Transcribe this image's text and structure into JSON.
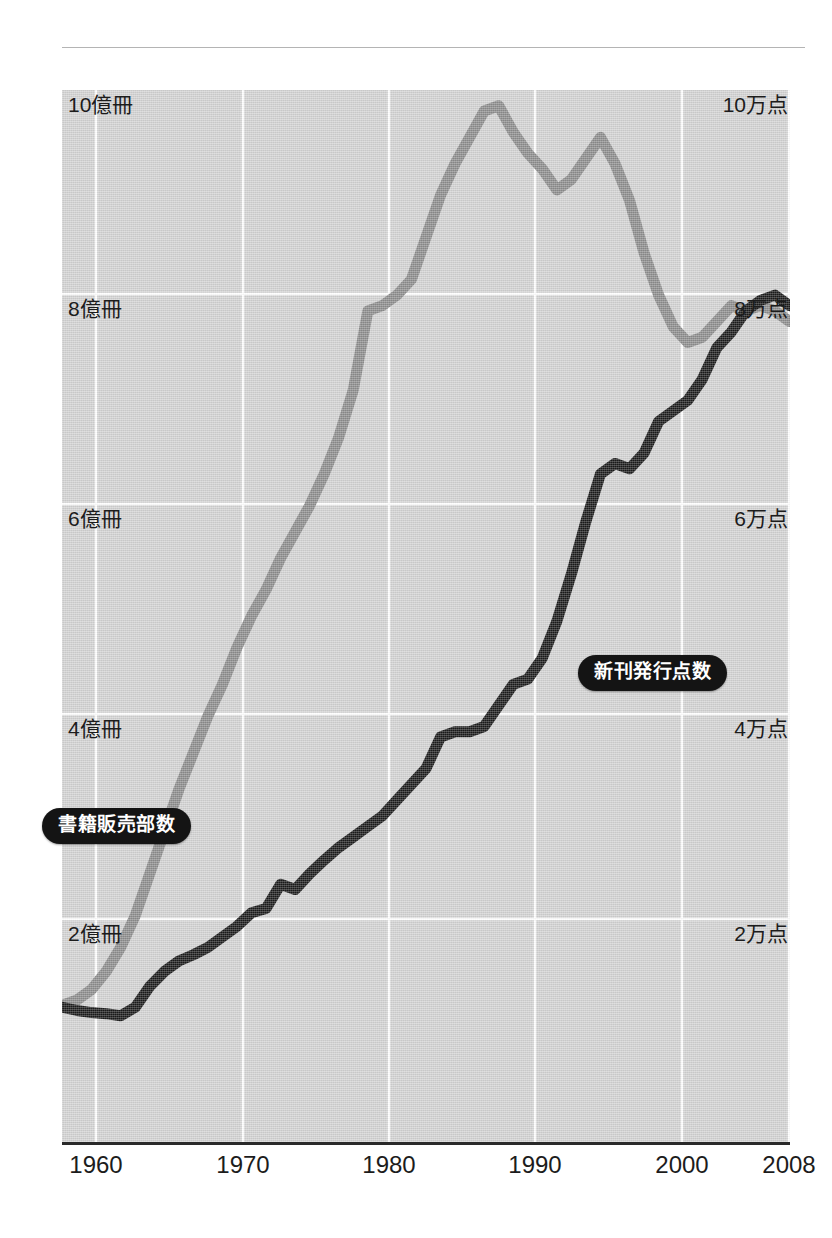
{
  "figure": {
    "background_color": "#ffffff",
    "panel_color": "#d2d2d2",
    "rule_color": "#b4b4b4",
    "axis_color": "#2a2a2a"
  },
  "callouts": {
    "sales": "書籍販売部数",
    "titles": "新刊発行点数"
  },
  "chart_data": {
    "type": "line",
    "title": "",
    "subtitle": "",
    "xlabel": "",
    "ylabel": "",
    "grid": true,
    "legend_position": "inline-callout",
    "xlim": [
      1958,
      2008
    ],
    "x_ticks": [
      1960,
      1970,
      1980,
      1990,
      2000,
      2008
    ],
    "x_tick_labels": [
      "1960",
      "1970",
      "1980",
      "1990",
      "2000",
      "2008"
    ],
    "axes": [
      {
        "id": "left",
        "label_suffix": "億冊",
        "unit": "億冊",
        "ylim": [
          0,
          10
        ],
        "ticks": [
          2,
          4,
          6,
          8,
          10
        ],
        "tick_labels": [
          "2億冊",
          "4億冊",
          "6億冊",
          "8億冊",
          "10億冊"
        ],
        "series_color": "#8c8c8c"
      },
      {
        "id": "right",
        "label_suffix": "万点",
        "unit": "万点",
        "ylim": [
          0,
          10
        ],
        "ticks": [
          2,
          4,
          6,
          8,
          10
        ],
        "tick_labels": [
          "2万点",
          "4万点",
          "6万点",
          "8万点",
          "10万点"
        ],
        "series_color": "#1a1a1a"
      }
    ],
    "x": [
      1958,
      1959,
      1960,
      1961,
      1962,
      1963,
      1964,
      1965,
      1966,
      1967,
      1968,
      1969,
      1970,
      1971,
      1972,
      1973,
      1974,
      1975,
      1976,
      1977,
      1978,
      1979,
      1980,
      1981,
      1982,
      1983,
      1984,
      1985,
      1986,
      1987,
      1988,
      1989,
      1990,
      1991,
      1992,
      1993,
      1994,
      1995,
      1996,
      1997,
      1998,
      1999,
      2000,
      2001,
      2002,
      2003,
      2004,
      2005,
      2006,
      2007,
      2008
    ],
    "series": [
      {
        "name": "書籍販売部数",
        "axis": "left",
        "unit": "億冊",
        "color": "#8c8c8c",
        "values": [
          1.3,
          1.35,
          1.45,
          1.62,
          1.85,
          2.15,
          2.55,
          2.95,
          3.35,
          3.7,
          4.05,
          4.35,
          4.7,
          5.0,
          5.25,
          5.55,
          5.8,
          6.05,
          6.35,
          6.7,
          7.15,
          7.9,
          7.95,
          8.05,
          8.2,
          8.6,
          9.0,
          9.3,
          9.55,
          9.8,
          9.85,
          9.6,
          9.4,
          9.25,
          9.05,
          9.15,
          9.35,
          9.55,
          9.3,
          8.95,
          8.45,
          8.05,
          7.75,
          7.6,
          7.65,
          7.8,
          7.95,
          7.9,
          7.95,
          7.9,
          7.8
        ]
      },
      {
        "name": "新刊発行点数",
        "axis": "right",
        "unit": "万点",
        "color": "#1a1a1a",
        "values": [
          1.28,
          1.25,
          1.23,
          1.22,
          1.2,
          1.28,
          1.48,
          1.62,
          1.72,
          1.78,
          1.85,
          1.95,
          2.05,
          2.18,
          2.22,
          2.45,
          2.4,
          2.55,
          2.68,
          2.8,
          2.9,
          3.0,
          3.1,
          3.25,
          3.4,
          3.55,
          3.85,
          3.9,
          3.9,
          3.95,
          4.15,
          4.35,
          4.4,
          4.6,
          4.95,
          5.4,
          5.9,
          6.35,
          6.45,
          6.4,
          6.55,
          6.85,
          6.95,
          7.05,
          7.25,
          7.55,
          7.7,
          7.9,
          8.0,
          8.05,
          7.95
        ]
      }
    ],
    "annotations": [
      {
        "text": "書籍販売部数",
        "x": 1959.5,
        "y": 3.1,
        "axis": "left",
        "style": "black-pill"
      },
      {
        "text": "新刊発行点数",
        "x": 1994.0,
        "y": 4.9,
        "axis": "right",
        "style": "black-pill"
      }
    ]
  }
}
